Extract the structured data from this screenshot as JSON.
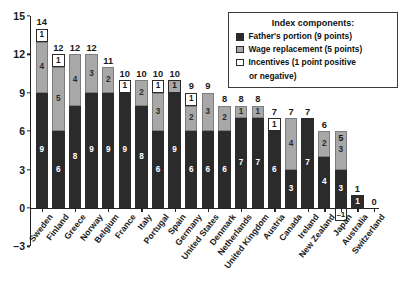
{
  "chart_data": {
    "type": "bar",
    "title": "",
    "xlabel": "",
    "ylabel": "",
    "ylim": [
      -3,
      15
    ],
    "yticks": [
      15,
      12,
      9,
      6,
      3,
      0,
      "–3"
    ],
    "grid": false,
    "stacked": true,
    "legend_position": "top-right",
    "categories": [
      "Sweden",
      "Finland",
      "Greece",
      "Norway",
      "Belgium",
      "France",
      "Italy",
      "Portugal",
      "Spain",
      "Germany",
      "United States",
      "Denmark",
      "Netherlands",
      "United Kingdom",
      "Austria",
      "Canada",
      "Ireland",
      "New Zealand",
      "Japan",
      "Australia",
      "Switzerland"
    ],
    "series": [
      {
        "name": "Father's portion (9 points)",
        "key": "father",
        "color": "#2b2b2b",
        "values": [
          9,
          6,
          8,
          9,
          9,
          9,
          8,
          6,
          9,
          6,
          6,
          6,
          7,
          7,
          6,
          3,
          7,
          4,
          3,
          1,
          0
        ]
      },
      {
        "name": "Wage replacement (5 points)",
        "key": "wage",
        "color": "#a8a8a8",
        "values": [
          4,
          5,
          4,
          3,
          2,
          0,
          2,
          3,
          0,
          2,
          3,
          2,
          1,
          1,
          0,
          4,
          0,
          2,
          3,
          0,
          0
        ]
      },
      {
        "name": "Incentives (1 point positive or negative)",
        "key": "incentives",
        "color": "#ffffff",
        "values": [
          1,
          1,
          0,
          0,
          0,
          1,
          0,
          1,
          1,
          1,
          0,
          0,
          0,
          0,
          1,
          0,
          0,
          0,
          -1,
          0,
          0
        ]
      }
    ],
    "totals": [
      14,
      12,
      12,
      12,
      11,
      10,
      10,
      10,
      10,
      9,
      9,
      8,
      8,
      8,
      7,
      7,
      7,
      6,
      5,
      1,
      0
    ],
    "bars": [
      {
        "country": "Sweden",
        "total": 14,
        "father": 9,
        "wage": 4,
        "incentives": 1,
        "inc_shaded": false
      },
      {
        "country": "Finland",
        "total": 12,
        "father": 6,
        "wage": 5,
        "incentives": 1,
        "inc_shaded": false
      },
      {
        "country": "Greece",
        "total": 12,
        "father": 8,
        "wage": 4,
        "incentives": 0,
        "inc_shaded": false
      },
      {
        "country": "Norway",
        "total": 12,
        "father": 9,
        "wage": 3,
        "incentives": 0,
        "inc_shaded": false
      },
      {
        "country": "Belgium",
        "total": 11,
        "father": 9,
        "wage": 2,
        "incentives": 0,
        "inc_shaded": false
      },
      {
        "country": "France",
        "total": 10,
        "father": 9,
        "wage": 0,
        "incentives": 1,
        "inc_shaded": false
      },
      {
        "country": "Italy",
        "total": 10,
        "father": 8,
        "wage": 2,
        "incentives": 0,
        "inc_shaded": false
      },
      {
        "country": "Portugal",
        "total": 10,
        "father": 6,
        "wage": 3,
        "incentives": 1,
        "inc_shaded": false
      },
      {
        "country": "Spain",
        "total": 10,
        "father": 9,
        "wage": 0,
        "incentives": 1,
        "inc_shaded": true
      },
      {
        "country": "Germany",
        "total": 9,
        "father": 6,
        "wage": 2,
        "incentives": 1,
        "inc_shaded": false
      },
      {
        "country": "United States",
        "total": 9,
        "father": 6,
        "wage": 3,
        "incentives": 0,
        "inc_shaded": false
      },
      {
        "country": "Denmark",
        "total": 8,
        "father": 6,
        "wage": 2,
        "incentives": 0,
        "inc_shaded": false
      },
      {
        "country": "Netherlands",
        "total": 8,
        "father": 7,
        "wage": 1,
        "incentives": 0,
        "inc_shaded": false
      },
      {
        "country": "United Kingdom",
        "total": 8,
        "father": 7,
        "wage": 1,
        "incentives": 0,
        "inc_shaded": false
      },
      {
        "country": "Austria",
        "total": 7,
        "father": 6,
        "wage": 0,
        "incentives": 1,
        "inc_shaded": false
      },
      {
        "country": "Canada",
        "total": 7,
        "father": 3,
        "wage": 4,
        "incentives": 0,
        "inc_shaded": false
      },
      {
        "country": "Ireland",
        "total": 7,
        "father": 7,
        "wage": 0,
        "incentives": 0,
        "inc_shaded": false
      },
      {
        "country": "New Zealand",
        "total": 6,
        "father": 4,
        "wage": 2,
        "incentives": 0,
        "inc_shaded": false
      },
      {
        "country": "Japan",
        "total": 5,
        "father": 3,
        "wage": 3,
        "incentives": -1,
        "inc_shaded": false
      },
      {
        "country": "Australia",
        "total": 1,
        "father": 1,
        "wage": 0,
        "incentives": 0,
        "inc_shaded": false
      },
      {
        "country": "Switzerland",
        "total": 0,
        "father": 0,
        "wage": 0,
        "incentives": 0,
        "inc_shaded": false
      }
    ]
  },
  "legend": {
    "title": "Index components:",
    "items": [
      {
        "swatch": "father",
        "label": "Father's portion (9 points)"
      },
      {
        "swatch": "wage",
        "label": "Wage replacement (5 points)"
      },
      {
        "swatch": "incentives",
        "label": "Incentives (1 point positive",
        "label2": "or negative)"
      }
    ]
  }
}
